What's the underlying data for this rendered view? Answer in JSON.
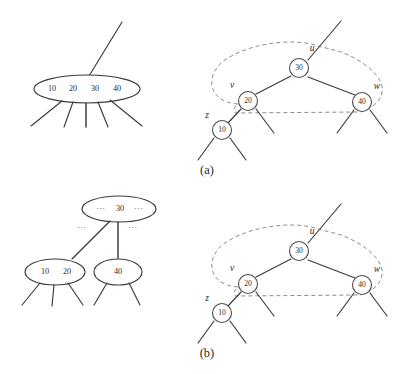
{
  "figure": {
    "background_color": "#ffffff",
    "stroke_color": "#3a3a3a",
    "dashed_group_color": "#8c8c8c",
    "panels": [
      {
        "id": "a",
        "caption": "(a)",
        "left_diagram": {
          "kind": "multiway-node",
          "nodes": [
            {
              "id": "a-big-node",
              "keys": [
                "10",
                "20",
                "30",
                "40"
              ],
              "children_stubs": 5,
              "parent_stub": true
            }
          ]
        },
        "right_diagram": {
          "kind": "binary-search-tree",
          "nodes": [
            {
              "id": "a-node-30",
              "key": "30",
              "label": "u"
            },
            {
              "id": "a-node-20",
              "key": "20",
              "label": "v"
            },
            {
              "id": "a-node-40",
              "key": "40",
              "label": "w"
            },
            {
              "id": "a-node-10",
              "key": "10",
              "label": "z"
            }
          ],
          "group_outline": "dashed"
        }
      },
      {
        "id": "b",
        "caption": "(b)",
        "left_diagram": {
          "kind": "multiway-node-split",
          "nodes": [
            {
              "id": "b-parent-node",
              "keys": [
                "…",
                "30",
                "…"
              ],
              "children_stubs": 0,
              "parent_stub": false
            },
            {
              "id": "b-child-left",
              "keys": [
                "10",
                "20"
              ],
              "children_stubs": 3,
              "parent_stub": false
            },
            {
              "id": "b-child-right",
              "keys": [
                "40"
              ],
              "children_stubs": 2,
              "parent_stub": false
            }
          ],
          "edge_labels": [
            "…",
            "…"
          ]
        },
        "right_diagram": {
          "kind": "binary-search-tree",
          "nodes": [
            {
              "id": "b-node-30",
              "key": "30",
              "label": "u"
            },
            {
              "id": "b-node-20",
              "key": "20",
              "label": "v"
            },
            {
              "id": "b-node-40",
              "key": "40",
              "label": "w"
            },
            {
              "id": "b-node-10",
              "key": "10",
              "label": "z"
            }
          ],
          "group_outline": "dashed"
        }
      }
    ]
  },
  "panel_a": {
    "caption": "(a)",
    "big_node_keys": {
      "k1": "10",
      "k2": "20",
      "k3": "30",
      "k4": "40"
    },
    "tree": {
      "root_key": "30",
      "left_key": "20",
      "right_key": "40",
      "leftleft_key": "10",
      "label_u": "u",
      "label_v": "v",
      "label_w": "w",
      "label_z": "z"
    }
  },
  "panel_b": {
    "caption": "(b)",
    "parent_node": {
      "left_dots": "···",
      "key": "30",
      "right_dots": "···"
    },
    "edge_dots": {
      "left": "···",
      "right": "···"
    },
    "child_left": {
      "k1": "10",
      "k2": "20"
    },
    "child_right": {
      "k1": "40"
    },
    "tree": {
      "root_key": "30",
      "left_key": "20",
      "right_key": "40",
      "leftleft_key": "10",
      "label_u": "u",
      "label_v": "v",
      "label_w": "w",
      "label_z": "z"
    }
  }
}
